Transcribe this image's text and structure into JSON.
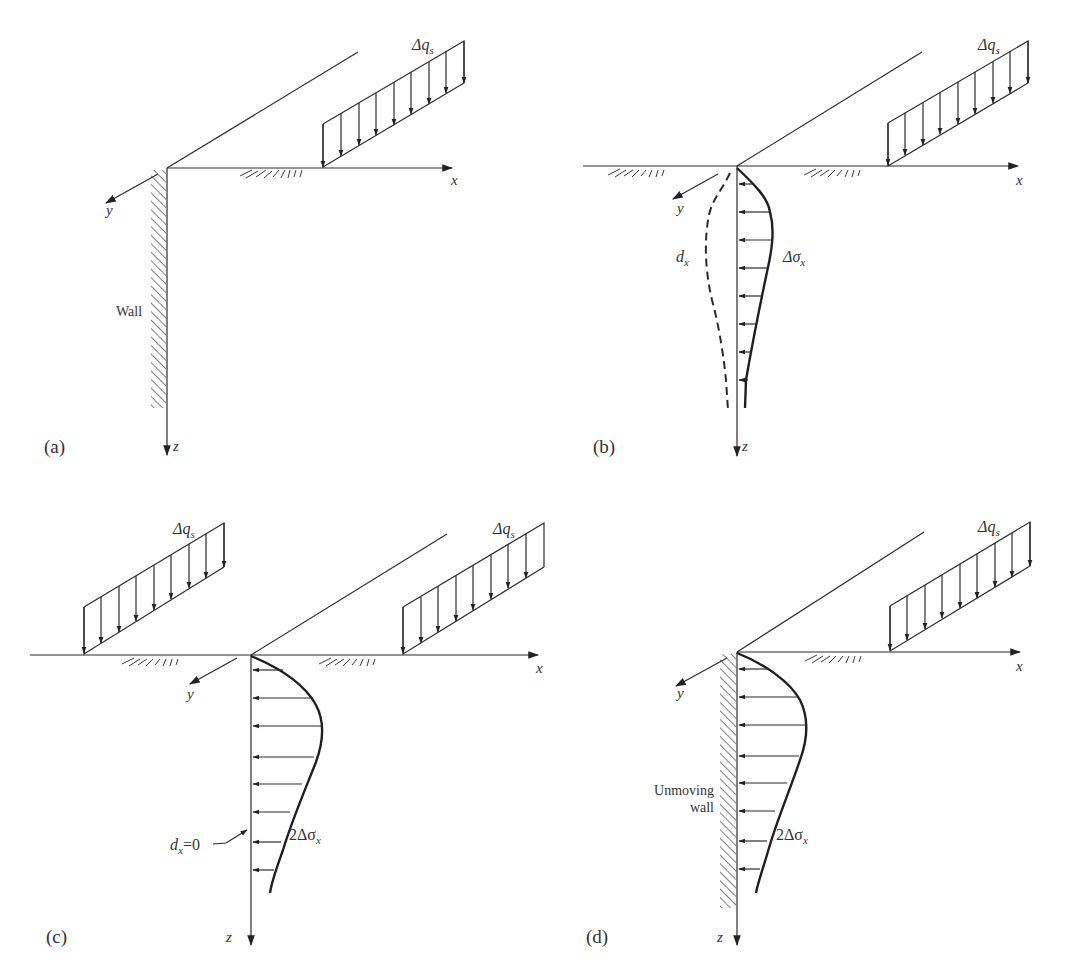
{
  "figure": {
    "panels": [
      {
        "id": "a",
        "label": "(a)",
        "axes": {
          "x": "x",
          "y": "y",
          "z": "z"
        },
        "load_label_main": "Δq",
        "load_label_sub": "s",
        "wall_label": "Wall"
      },
      {
        "id": "b",
        "label": "(b)",
        "axes": {
          "x": "x",
          "y": "y",
          "z": "z"
        },
        "load_label_main": "Δq",
        "load_label_sub": "s",
        "displacement_label_main": "d",
        "displacement_label_sub": "x",
        "stress_label_main": "Δσ",
        "stress_label_sub": "x"
      },
      {
        "id": "c",
        "label": "(c)",
        "axes": {
          "x": "x",
          "y": "y",
          "z": "z"
        },
        "load_left_label_main": "Δq",
        "load_left_label_sub": "s",
        "load_right_label_main": "Δq",
        "load_right_label_sub": "s",
        "displacement_label_main": "d",
        "displacement_label_sub": "x",
        "displacement_label_suffix": "=0",
        "stress_label_main": "2Δσ",
        "stress_label_sub": "x"
      },
      {
        "id": "d",
        "label": "(d)",
        "axes": {
          "x": "x",
          "y": "y",
          "z": "z"
        },
        "load_label_main": "Δq",
        "load_label_sub": "s",
        "wall_label_line1": "Unmoving",
        "wall_label_line2": "wall",
        "stress_label_main": "2Δσ",
        "stress_label_sub": "x"
      }
    ],
    "colors": {
      "ink": "#2b2b2b",
      "background": "#ffffff"
    }
  }
}
